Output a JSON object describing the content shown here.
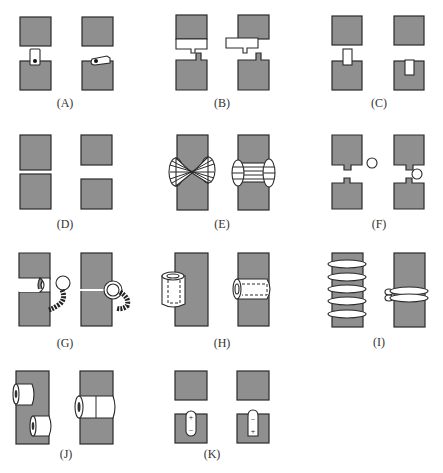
{
  "figure": {
    "panels": [
      {
        "id": "A",
        "label": "(A)",
        "description": "Two blocks with a small tab carrying a dot; tab bridging gap vs tab rotated onto lower block"
      },
      {
        "id": "B",
        "label": "(B)",
        "description": "Upper block with rectangular flap having a stem that notches into a stub on the lower block; flap shifted left"
      },
      {
        "id": "C",
        "label": "(C)",
        "description": "Small rectangular plug bridging the gap vs plug seated into the lower block"
      },
      {
        "id": "D",
        "label": "(D)",
        "description": "Two blocks touching vs two blocks separated"
      },
      {
        "id": "E",
        "label": "(E)",
        "description": "Bar wrapped with crossed lacing (figure-eight) vs parallel binding between two collars"
      },
      {
        "id": "F",
        "label": "(F)",
        "description": "Notched upper block and tabbed lower block with a small ring beside vs ring in the gap"
      },
      {
        "id": "G",
        "label": "(G)",
        "description": "Ball-and-socket joint with a coiled spring/tail; open vs snapped into the socket"
      },
      {
        "id": "H",
        "label": "(H)",
        "description": "Hollow sleeve (tube) beside a bar vs sleeve slid horizontally across the bar"
      },
      {
        "id": "I",
        "label": "(I)",
        "description": "Bar with five separate rings vs bar with rings stacked together"
      },
      {
        "id": "J",
        "label": "(J)",
        "description": "Two separate cylindrical beads on a bar vs beads joined end-to-end"
      },
      {
        "id": "K",
        "label": "(K)",
        "description": "Lower block with capsule showing + on top and − at bottom vs capsule reversed with + at bottom"
      }
    ],
    "symbols": {
      "plus": "+",
      "minus": "−"
    },
    "colors": {
      "block_fill": "#8f8f8f",
      "outline": "#2a2a2a",
      "background": "#ffffff",
      "label_text": "#333333"
    }
  }
}
